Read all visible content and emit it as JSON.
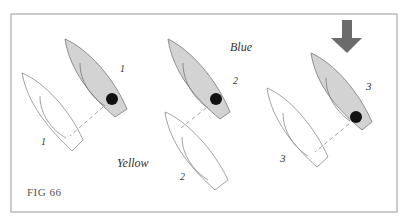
{
  "figure": {
    "caption": "FIG 66",
    "frame": {
      "x": 11,
      "y": 14,
      "width": 386,
      "height": 198,
      "stroke": "#a8a8a8"
    },
    "colors": {
      "blue_fill": "#d3d3d3",
      "blue_stroke": "#777777",
      "yellow_fill": "#ffffff",
      "yellow_stroke": "#8a8a8a",
      "dot": "#111111",
      "arrow": "#6b6b6b",
      "dash": "#9a9a9a"
    },
    "labels": {
      "blue": "Blue",
      "yellow": "Yellow"
    },
    "wind_arrow": {
      "icon": "down-arrow",
      "direction": "down"
    },
    "positions": [
      {
        "step": "1",
        "blue": {
          "label": "1"
        },
        "yellow": {
          "label": "1"
        }
      },
      {
        "step": "2",
        "blue": {
          "label": "2"
        },
        "yellow": {
          "label": "2"
        }
      },
      {
        "step": "3",
        "blue": {
          "label": "3"
        },
        "yellow": {
          "label": "3"
        }
      }
    ]
  }
}
